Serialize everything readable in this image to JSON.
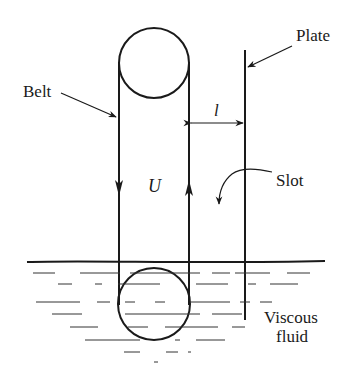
{
  "labels": {
    "belt": "Belt",
    "plate": "Plate",
    "gap": "l",
    "velocity": "U",
    "slot": "Slot",
    "fluid_line1": "Viscous",
    "fluid_line2": "fluid"
  },
  "colors": {
    "ink": "#1a1a1a",
    "background": "#ffffff"
  }
}
